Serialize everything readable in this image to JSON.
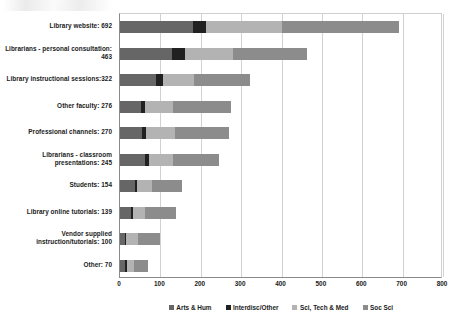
{
  "chart_data": {
    "type": "bar",
    "orientation": "horizontal",
    "stacked": true,
    "title": "",
    "xlabel": "",
    "ylabel": "",
    "xlim": [
      0,
      800
    ],
    "xticks": [
      0,
      100,
      200,
      300,
      400,
      500,
      600,
      700,
      800
    ],
    "grid": "vertical",
    "legend_position": "bottom",
    "categories": [
      "Library website: 692",
      "Librarians - personal consultation: 463",
      "Library instructional sessions:322",
      "Other faculty: 276",
      "Professional channels: 270",
      "Librarians - classroom presentations: 245",
      "Students: 154",
      "Library online tutorials: 139",
      "Vendor supplied instruction/tutorials: 100",
      "Other: 70"
    ],
    "category_totals": [
      692,
      463,
      322,
      276,
      270,
      245,
      154,
      139,
      100,
      70
    ],
    "series": [
      {
        "name": "Arts & Hum",
        "color": "#666666",
        "values": [
          180,
          130,
          90,
          52,
          55,
          62,
          36,
          28,
          12,
          13
        ]
      },
      {
        "name": "Interdisc/Other",
        "color": "#212121",
        "values": [
          32,
          30,
          16,
          9,
          9,
          9,
          5,
          4,
          4,
          4
        ]
      },
      {
        "name": "Sci, Tech & Med",
        "color": "#b3b3b3",
        "values": [
          190,
          120,
          78,
          70,
          72,
          60,
          38,
          31,
          28,
          18
        ]
      },
      {
        "name": "Soc Sci",
        "color": "#8c8c8c",
        "values": [
          290,
          183,
          138,
          145,
          134,
          114,
          75,
          76,
          56,
          35
        ]
      }
    ]
  },
  "legend": {
    "items": [
      {
        "label": "Arts & Hum",
        "color": "#666666"
      },
      {
        "label": "Interdisc/Other",
        "color": "#212121"
      },
      {
        "label": "Sci, Tech & Med",
        "color": "#b3b3b3"
      },
      {
        "label": "Soc Sci",
        "color": "#8c8c8c"
      }
    ]
  }
}
